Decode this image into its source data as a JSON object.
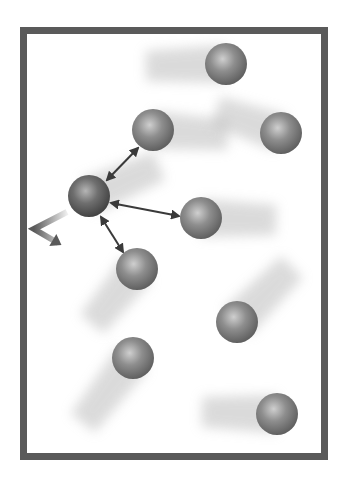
{
  "diagram": {
    "title": "",
    "colors": {
      "background": "#ffffff",
      "container_border": "#5a5a5a",
      "sphere_base": "#8a8a8a",
      "sphere_highlight": "#c8c8c8",
      "sphere_shadow": "#555555",
      "trail": "#bdbdbd",
      "arrow": "#3a3a3a",
      "bounce_arrow": "#5a5a5a"
    },
    "container": {
      "x": 20,
      "y": 27,
      "width": 308,
      "height": 433,
      "border_width": 7
    },
    "sphere_radius": 21,
    "molecules": [
      {
        "id": "A",
        "cx": 226,
        "cy": 64,
        "trail": {
          "dx": -80,
          "dy": 2
        }
      },
      {
        "id": "B",
        "cx": 153,
        "cy": 130,
        "trail": {
          "dx": 75,
          "dy": 5
        }
      },
      {
        "id": "C",
        "cx": 281,
        "cy": 133,
        "trail": {
          "dx": -65,
          "dy": -22
        }
      },
      {
        "id": "D",
        "cx": 89,
        "cy": 196,
        "trail": {
          "dx": 70,
          "dy": -30
        },
        "highlighted": true
      },
      {
        "id": "E",
        "cx": 201,
        "cy": 218,
        "trail": {
          "dx": 75,
          "dy": 2
        }
      },
      {
        "id": "F",
        "cx": 137,
        "cy": 269,
        "trail": {
          "dx": -45,
          "dy": 55
        }
      },
      {
        "id": "G",
        "cx": 237,
        "cy": 322,
        "trail": {
          "dx": 55,
          "dy": -55
        }
      },
      {
        "id": "H",
        "cx": 133,
        "cy": 358,
        "trail": {
          "dx": -50,
          "dy": 65
        }
      },
      {
        "id": "I",
        "cx": 277,
        "cy": 414,
        "trail": {
          "dx": -75,
          "dy": -2
        }
      }
    ],
    "interaction_arrows": [
      {
        "from": "D",
        "to": "B",
        "x1": 107,
        "y1": 180,
        "x2": 138,
        "y2": 148
      },
      {
        "from": "D",
        "to": "E",
        "x1": 111,
        "y1": 203,
        "x2": 179,
        "y2": 216
      },
      {
        "from": "D",
        "to": "F",
        "x1": 101,
        "y1": 217,
        "x2": 123,
        "y2": 252
      }
    ],
    "bounce_arrow": {
      "points": [
        [
          67,
          212
        ],
        [
          34,
          229
        ],
        [
          58,
          243
        ]
      ]
    }
  }
}
